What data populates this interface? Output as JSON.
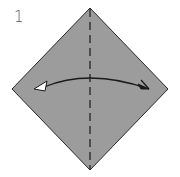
{
  "step": {
    "number": "1"
  },
  "paper": {
    "shape": "square-diamond",
    "fill_color": "#9c9c9c",
    "edge_color": "#2a2a2a",
    "vertices": {
      "top": [
        90,
        8
      ],
      "right": [
        168,
        89
      ],
      "bottom": [
        90,
        170
      ],
      "left": [
        12,
        89
      ]
    }
  },
  "fold_line": {
    "type": "valley-fold-dashed",
    "orientation": "vertical",
    "color": "#1a1a1a"
  },
  "arrow": {
    "type": "fold-and-unfold",
    "direction": "right-to-left-and-back",
    "left_head": "hollow-white-arrowhead",
    "right_head": "half-filled-arrowhead",
    "color": "#1a1a1a"
  }
}
